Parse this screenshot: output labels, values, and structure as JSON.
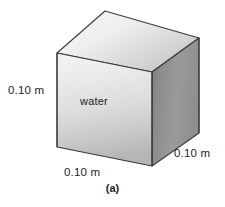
{
  "figure": {
    "caption": "(a)",
    "substance_label": "water",
    "dimensions": {
      "height_label": "0.10 m",
      "width_label": "0.10 m",
      "depth_label": "0.10 m"
    },
    "shape": {
      "name": "cube",
      "projection": "oblique",
      "faces": [
        {
          "name": "front-face",
          "points": "57,53 152,72 152,166 57,147",
          "fill": "url(#frontGradient)"
        },
        {
          "name": "top-face",
          "points": "57,53 105,11 199,38 152,72",
          "fill": "url(#topGradient)"
        },
        {
          "name": "right-face",
          "points": "152,72 199,38 199,133 152,166",
          "fill": "url(#rightGradient)"
        }
      ],
      "edge_color": "#3a3a3a",
      "edge_width": 1.1
    },
    "colors": {
      "front_light": "#f2f2f2",
      "front_dark": "#bababa",
      "top_light": "#f4f4f4",
      "top_dark": "#c4c4c4",
      "right_light": "#a2a2a2",
      "right_dark": "#7d7d7d",
      "outline": "#3a3a3a",
      "text": "#231f20",
      "background": "#ffffff"
    }
  }
}
